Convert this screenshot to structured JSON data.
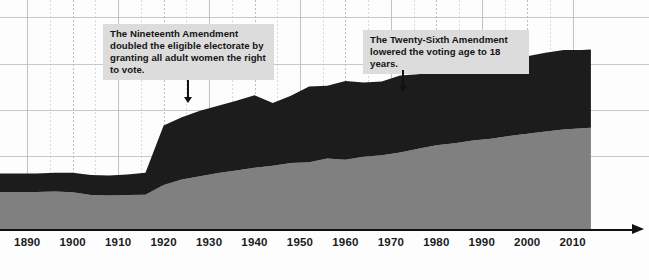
{
  "chart_data": {
    "type": "area",
    "title": "",
    "xlabel": "",
    "ylabel": "",
    "stacked": true,
    "grid": true,
    "legend": "none",
    "xlim": [
      1884,
      2016
    ],
    "ylim": [
      0,
      100
    ],
    "x_ticks": [
      1890,
      1900,
      1910,
      1920,
      1930,
      1940,
      1950,
      1960,
      1970,
      1980,
      1990,
      2000,
      2010
    ],
    "series": [
      {
        "name": "lower-band",
        "color": "#808080",
        "x": [
          1884,
          1888,
          1892,
          1896,
          1900,
          1904,
          1908,
          1912,
          1916,
          1920,
          1924,
          1928,
          1932,
          1936,
          1940,
          1944,
          1948,
          1952,
          1956,
          1960,
          1964,
          1968,
          1972,
          1976,
          1980,
          1984,
          1988,
          1992,
          1996,
          2000,
          2004,
          2008,
          2012,
          2014
        ],
        "values": [
          16.0,
          16.0,
          16.2,
          16.4,
          16.0,
          14.8,
          14.6,
          14.8,
          15.0,
          19.2,
          21.6,
          23.0,
          24.4,
          25.6,
          26.8,
          27.6,
          28.8,
          29.2,
          30.8,
          30.2,
          31.6,
          32.2,
          33.4,
          35.0,
          36.6,
          37.4,
          38.6,
          39.4,
          40.6,
          41.6,
          42.6,
          43.4,
          44.0,
          44.2
        ]
      },
      {
        "name": "upper-band",
        "color": "#1c1c1c",
        "x": [
          1884,
          1888,
          1892,
          1896,
          1900,
          1904,
          1908,
          1912,
          1916,
          1920,
          1924,
          1928,
          1932,
          1936,
          1940,
          1944,
          1948,
          1952,
          1956,
          1960,
          1964,
          1968,
          1972,
          1976,
          1980,
          1984,
          1988,
          1992,
          1996,
          2000,
          2004,
          2008,
          2012,
          2014
        ],
        "values": [
          8.2,
          8.2,
          8.0,
          8.2,
          8.6,
          8.8,
          8.8,
          9.0,
          9.6,
          26.0,
          27.2,
          28.6,
          29.4,
          30.4,
          31.6,
          27.4,
          29.4,
          33.0,
          31.8,
          34.4,
          32.4,
          32.2,
          33.6,
          32.6,
          33.0,
          33.4,
          32.6,
          34.4,
          33.2,
          33.8,
          34.4,
          34.8,
          34.2,
          34.2
        ]
      }
    ],
    "annotations": [
      {
        "id": "nineteenth-amendment",
        "text": "The Nineteenth Amendment doubled the eligible electorate by granting all adult women the right to vote.",
        "points_to_year": 1920
      },
      {
        "id": "twenty-sixth-amendment",
        "text": "The Twenty-Sixth Amendment lowered the voting age to 18 years.",
        "points_to_year": 1971
      }
    ]
  },
  "colors": {
    "upper_band": "#1c1c1c",
    "lower_band": "#808080",
    "callout_bg": "#dcdcdc",
    "axis": "#111111",
    "grid": "#c9c9c9",
    "background": "#fdfdfd"
  }
}
